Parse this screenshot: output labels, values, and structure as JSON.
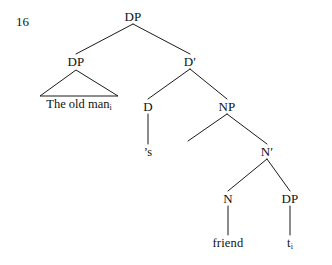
{
  "figure": {
    "example_number": "16",
    "ink_color": "#1a1a1a",
    "background_color": "#ffffff"
  },
  "nodes": [
    {
      "id": "root-dp",
      "label": "DP",
      "x": 133,
      "y": 16,
      "kind": "phrasal"
    },
    {
      "id": "spec-dp",
      "label": "DP",
      "x": 76,
      "y": 61,
      "kind": "phrasal"
    },
    {
      "id": "d-bar",
      "label": "D′",
      "x": 190,
      "y": 61,
      "kind": "phrasal"
    },
    {
      "id": "d-head",
      "label": "D",
      "x": 148,
      "y": 106,
      "kind": "phrasal"
    },
    {
      "id": "np",
      "label": "NP",
      "x": 227,
      "y": 106,
      "kind": "phrasal"
    },
    {
      "id": "n-bar",
      "label": "N′",
      "x": 267,
      "y": 151,
      "kind": "phrasal"
    },
    {
      "id": "n-head",
      "label": "N",
      "x": 228,
      "y": 198,
      "kind": "phrasal"
    },
    {
      "id": "obj-dp",
      "label": "DP",
      "x": 290,
      "y": 198,
      "kind": "phrasal"
    }
  ],
  "terminals": [
    {
      "id": "possessive",
      "label": "’s",
      "x": 148,
      "y": 152
    },
    {
      "id": "noun",
      "label": "friend",
      "x": 228,
      "y": 243
    },
    {
      "id": "trace",
      "label": "t",
      "subscript": "i",
      "x": 290,
      "y": 243
    }
  ],
  "triangle": {
    "id": "spec-dp-triangle",
    "apex_x": 76,
    "apex_y": 70,
    "left_x": 40,
    "right_x": 118,
    "base_y": 96,
    "label": "The old man",
    "subscript": "i",
    "label_x": 79,
    "label_y": 104
  },
  "branches": [
    {
      "id": "root-to-spec",
      "from": "root-dp",
      "to": "spec-dp",
      "x1": 133,
      "y1": 24,
      "x2": 76,
      "y2": 54
    },
    {
      "id": "root-to-dbar",
      "from": "root-dp",
      "to": "d-bar",
      "x1": 133,
      "y1": 24,
      "x2": 190,
      "y2": 54
    },
    {
      "id": "dbar-to-d",
      "from": "d-bar",
      "to": "d-head",
      "x1": 190,
      "y1": 69,
      "x2": 148,
      "y2": 99
    },
    {
      "id": "dbar-to-np",
      "from": "d-bar",
      "to": "np",
      "x1": 190,
      "y1": 69,
      "x2": 227,
      "y2": 99
    },
    {
      "id": "d-to-possessive",
      "from": "d-head",
      "to": "possessive",
      "x1": 148,
      "y1": 114,
      "x2": 148,
      "y2": 144
    },
    {
      "id": "np-spec-stub",
      "from": "np",
      "to": null,
      "x1": 227,
      "y1": 114,
      "x2": 188,
      "y2": 141
    },
    {
      "id": "np-to-nbar",
      "from": "np",
      "to": "n-bar",
      "x1": 227,
      "y1": 114,
      "x2": 267,
      "y2": 144
    },
    {
      "id": "nbar-to-n",
      "from": "n-bar",
      "to": "n-head",
      "x1": 267,
      "y1": 159,
      "x2": 228,
      "y2": 191
    },
    {
      "id": "nbar-to-dp",
      "from": "n-bar",
      "to": "obj-dp",
      "x1": 267,
      "y1": 159,
      "x2": 290,
      "y2": 191
    },
    {
      "id": "n-to-friend",
      "from": "n-head",
      "to": "noun",
      "x1": 228,
      "y1": 206,
      "x2": 228,
      "y2": 235
    },
    {
      "id": "dp-to-trace",
      "from": "obj-dp",
      "to": "trace",
      "x1": 290,
      "y1": 206,
      "x2": 290,
      "y2": 235
    }
  ]
}
